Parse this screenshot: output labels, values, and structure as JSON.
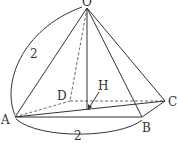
{
  "figure": {
    "type": "square pyramid",
    "vertices": {
      "O": "O",
      "A": "A",
      "B": "B",
      "C": "C",
      "D": "D",
      "H": "H"
    },
    "dimensions": {
      "edge_OA": "2",
      "edge_AB": "2"
    },
    "stroke_color": "#333333"
  }
}
